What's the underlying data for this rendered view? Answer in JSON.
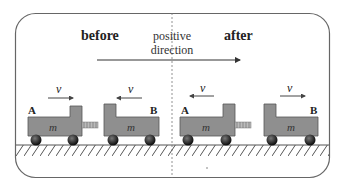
{
  "diagram": {
    "title_before": "before",
    "title_after": "after",
    "direction_label_line1": "positive",
    "direction_label_line2": "direction",
    "velocity_symbol": "v",
    "mass_symbol": "m",
    "cart_a_label": "A",
    "cart_b_label": "B",
    "colors": {
      "cart_fill": "#8f8f8f",
      "cart_stroke": "#555555",
      "wheel": "#1a1a1a",
      "border": "#555555",
      "text": "#222222"
    },
    "panels": [
      {
        "name": "before",
        "cart_a": {
          "velocity_direction": "right"
        },
        "cart_b": {
          "velocity_direction": "left"
        }
      },
      {
        "name": "after",
        "cart_a": {
          "velocity_direction": "left"
        },
        "cart_b": {
          "velocity_direction": "right"
        }
      }
    ]
  }
}
